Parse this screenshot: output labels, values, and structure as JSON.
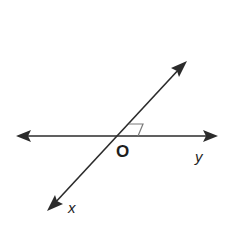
{
  "diagram": {
    "type": "intersecting-lines",
    "colors": {
      "line": "#2b2b2b",
      "angle_mark": "#7a7a7a",
      "background": "#ffffff"
    },
    "labels": {
      "intersection": "O",
      "ray_right": "y",
      "ray_lower_left": "x"
    },
    "markers": {
      "right_angle": true
    }
  }
}
